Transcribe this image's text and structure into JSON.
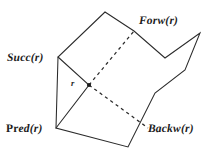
{
  "figure": {
    "kind": "geometric-diagram",
    "background_color": "#ffffff",
    "stroke_color": "#2b2b2b",
    "labels": {
      "succ": "Succ(r)",
      "forw": "Forw(r)",
      "pred": "Pred(r)",
      "pred_prefix": "Pr",
      "pred_suffix": "ed(r)",
      "backw": "Backw(r)",
      "point": "r"
    },
    "geometry": {
      "polygon_points": "105,12 58,57 56,128 128,147 155,93 185,70 200,33 165,58 134,31",
      "chord_solid_points": "58,57 89,85 56,128",
      "chord_dashed_forward": "89,85 134,31",
      "chord_dashed_backward": "89,85 148,128",
      "point_r": {
        "x": 89,
        "y": 85,
        "radius": 2.1
      }
    }
  }
}
